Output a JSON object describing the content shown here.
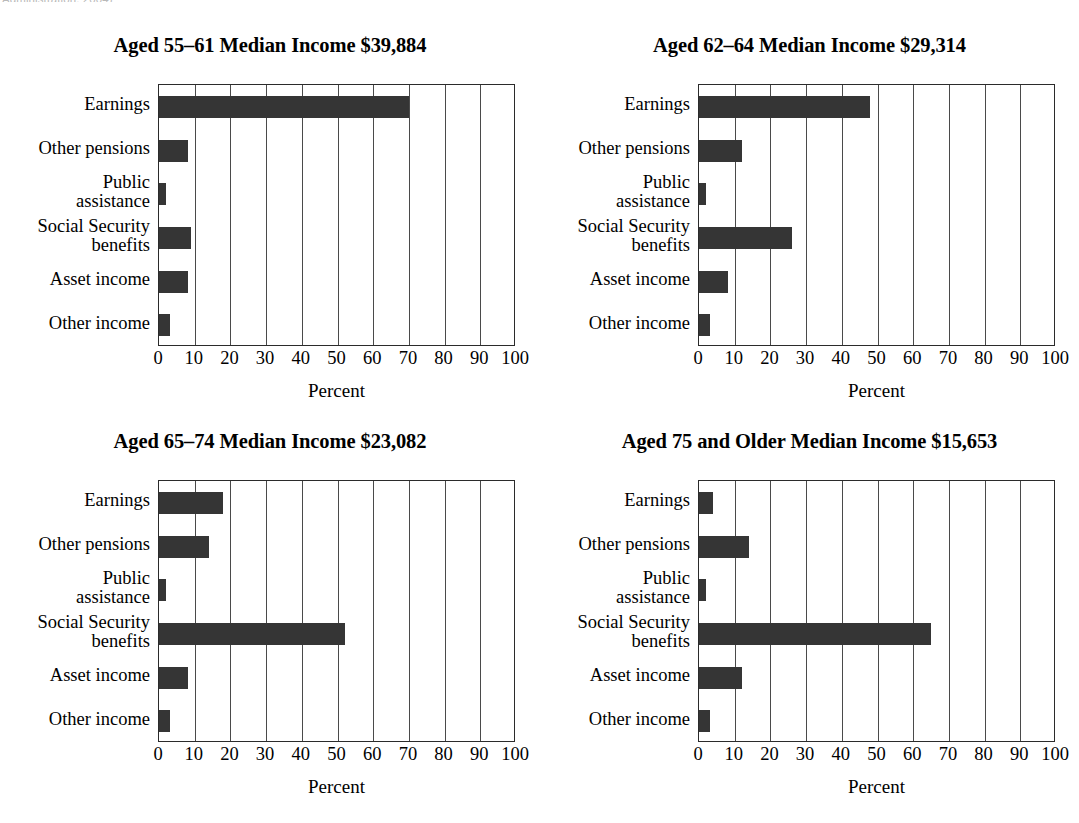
{
  "caption_fragment": "Administration, 2004)",
  "axis": {
    "xlabel": "Percent",
    "xticks": [
      "0",
      "10",
      "20",
      "30",
      "40",
      "50",
      "60",
      "70",
      "80",
      "90",
      "100"
    ],
    "xmin": 0,
    "xmax": 100
  },
  "categories": [
    "Earnings",
    "Other pensions",
    "Public\nassistance",
    "Social Security\nbenefits",
    "Asset income",
    "Other income"
  ],
  "colors": {
    "bar": "#353535",
    "axis": "#2b2b2b",
    "grid": "#4a4a4a",
    "background": "#ffffff"
  },
  "chart_data": [
    {
      "type": "bar",
      "title": "Aged 55–61 Median Income $39,884",
      "orientation": "horizontal",
      "categories": [
        "Earnings",
        "Other pensions",
        "Public assistance",
        "Social Security benefits",
        "Asset income",
        "Other income"
      ],
      "values": [
        70,
        8,
        2,
        9,
        8,
        3
      ],
      "xlabel": "Percent",
      "ylabel": "",
      "xlim": [
        0,
        100
      ],
      "grid": true,
      "legend": "none"
    },
    {
      "type": "bar",
      "title": "Aged 62–64 Median Income $29,314",
      "orientation": "horizontal",
      "categories": [
        "Earnings",
        "Other pensions",
        "Public assistance",
        "Social Security benefits",
        "Asset income",
        "Other income"
      ],
      "values": [
        48,
        12,
        2,
        26,
        8,
        3
      ],
      "xlabel": "Percent",
      "ylabel": "",
      "xlim": [
        0,
        100
      ],
      "grid": true,
      "legend": "none"
    },
    {
      "type": "bar",
      "title": "Aged 65–74 Median Income $23,082",
      "orientation": "horizontal",
      "categories": [
        "Earnings",
        "Other pensions",
        "Public assistance",
        "Social Security benefits",
        "Asset income",
        "Other income"
      ],
      "values": [
        18,
        14,
        2,
        52,
        8,
        3
      ],
      "xlabel": "Percent",
      "ylabel": "",
      "xlim": [
        0,
        100
      ],
      "grid": true,
      "legend": "none"
    },
    {
      "type": "bar",
      "title": "Aged 75 and Older Median Income $15,653",
      "orientation": "horizontal",
      "categories": [
        "Earnings",
        "Other pensions",
        "Public assistance",
        "Social Security benefits",
        "Asset income",
        "Other income"
      ],
      "values": [
        4,
        14,
        2,
        65,
        12,
        3
      ],
      "xlabel": "Percent",
      "ylabel": "",
      "xlim": [
        0,
        100
      ],
      "grid": true,
      "legend": "none"
    }
  ]
}
